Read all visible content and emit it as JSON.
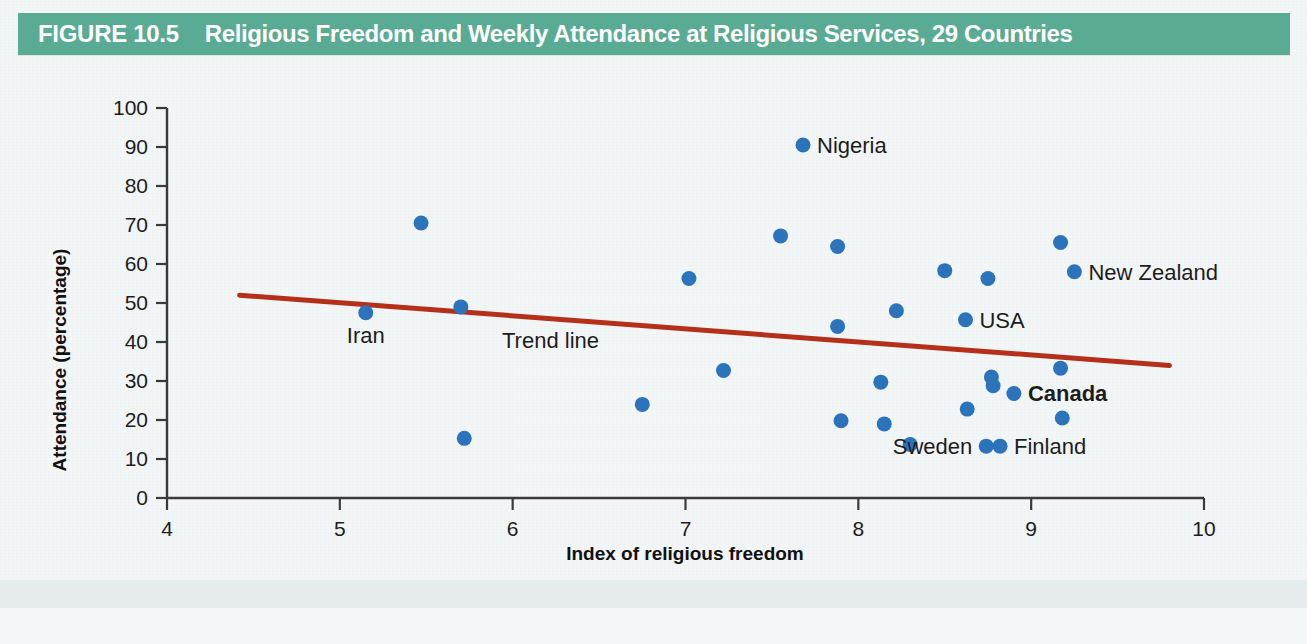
{
  "header": {
    "figure_number": "FIGURE 10.5",
    "title": "Religious Freedom and Weekly Attendance at Religious Services, 29 Countries",
    "bar_color": "#5aab93"
  },
  "source": {
    "text": ""
  },
  "chart_data": {
    "type": "scatter",
    "title": "Religious Freedom and Weekly Attendance at Religious Services, 29 Countries",
    "xlabel": "Index of religious freedom",
    "ylabel": "Attendance (percentage)",
    "xlim": [
      4,
      10
    ],
    "ylim": [
      0,
      100
    ],
    "xticks": [
      4,
      5,
      6,
      7,
      8,
      9,
      10
    ],
    "yticks": [
      0,
      10,
      20,
      30,
      40,
      50,
      60,
      70,
      80,
      90,
      100
    ],
    "grid": false,
    "legend": "none",
    "point_color": "#2b74bc",
    "trendline": {
      "label": "Trend line",
      "color": "#b4301b",
      "x": [
        4.42,
        9.8
      ],
      "y": [
        52.0,
        34.0
      ]
    },
    "points": [
      {
        "x": 5.15,
        "y": 47.5,
        "label": "Iran",
        "label_pos": "below",
        "bold": false
      },
      {
        "x": 5.47,
        "y": 70.5,
        "label": "",
        "label_pos": "",
        "bold": false
      },
      {
        "x": 5.7,
        "y": 49.0,
        "label": "",
        "label_pos": "",
        "bold": false
      },
      {
        "x": 5.72,
        "y": 15.3,
        "label": "",
        "label_pos": "",
        "bold": false
      },
      {
        "x": 6.75,
        "y": 24.0,
        "label": "",
        "label_pos": "",
        "bold": false
      },
      {
        "x": 7.02,
        "y": 56.3,
        "label": "",
        "label_pos": "",
        "bold": false
      },
      {
        "x": 7.22,
        "y": 32.7,
        "label": "",
        "label_pos": "",
        "bold": false
      },
      {
        "x": 7.55,
        "y": 67.2,
        "label": "",
        "label_pos": "",
        "bold": false
      },
      {
        "x": 7.68,
        "y": 90.5,
        "label": "Nigeria",
        "label_pos": "right",
        "bold": false
      },
      {
        "x": 7.88,
        "y": 64.5,
        "label": "",
        "label_pos": "",
        "bold": false
      },
      {
        "x": 7.88,
        "y": 44.0,
        "label": "",
        "label_pos": "",
        "bold": false
      },
      {
        "x": 7.9,
        "y": 19.8,
        "label": "",
        "label_pos": "",
        "bold": false
      },
      {
        "x": 8.13,
        "y": 29.7,
        "label": "",
        "label_pos": "",
        "bold": false
      },
      {
        "x": 8.15,
        "y": 19.0,
        "label": "",
        "label_pos": "",
        "bold": false
      },
      {
        "x": 8.22,
        "y": 48.0,
        "label": "",
        "label_pos": "",
        "bold": false
      },
      {
        "x": 8.3,
        "y": 13.7,
        "label": "",
        "label_pos": "",
        "bold": false
      },
      {
        "x": 8.5,
        "y": 58.3,
        "label": "",
        "label_pos": "",
        "bold": false
      },
      {
        "x": 8.62,
        "y": 45.7,
        "label": "USA",
        "label_pos": "right",
        "bold": false
      },
      {
        "x": 8.63,
        "y": 22.8,
        "label": "",
        "label_pos": "",
        "bold": false
      },
      {
        "x": 8.75,
        "y": 56.3,
        "label": "",
        "label_pos": "",
        "bold": false
      },
      {
        "x": 8.77,
        "y": 31.0,
        "label": "",
        "label_pos": "",
        "bold": false
      },
      {
        "x": 8.78,
        "y": 28.8,
        "label": "",
        "label_pos": "",
        "bold": false
      },
      {
        "x": 8.74,
        "y": 13.3,
        "label": "Sweden",
        "label_pos": "left",
        "bold": false
      },
      {
        "x": 8.82,
        "y": 13.3,
        "label": "Finland",
        "label_pos": "right",
        "bold": false
      },
      {
        "x": 8.9,
        "y": 26.8,
        "label": "Canada",
        "label_pos": "right",
        "bold": true
      },
      {
        "x": 9.17,
        "y": 65.5,
        "label": "",
        "label_pos": "",
        "bold": false
      },
      {
        "x": 9.25,
        "y": 58.0,
        "label": "New Zealand",
        "label_pos": "right",
        "bold": false
      },
      {
        "x": 9.17,
        "y": 33.3,
        "label": "",
        "label_pos": "",
        "bold": false
      },
      {
        "x": 9.18,
        "y": 20.5,
        "label": "",
        "label_pos": "",
        "bold": false
      }
    ]
  }
}
